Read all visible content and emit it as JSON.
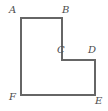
{
  "figure": {
    "kind": "l-shaped-polygon",
    "background_color": "#ffffff",
    "stroke_color": "#666666",
    "stroke_width": 1.2,
    "fill_color": "none",
    "label_color": "#4d4d4d",
    "width": 108,
    "height": 111,
    "vertices": [
      {
        "name": "A",
        "label": "A",
        "x": 21,
        "y": 18
      },
      {
        "name": "B",
        "label": "B",
        "x": 62,
        "y": 18
      },
      {
        "name": "C",
        "label": "C",
        "x": 62,
        "y": 60
      },
      {
        "name": "D",
        "label": "D",
        "x": 95,
        "y": 60
      },
      {
        "name": "E",
        "label": "E",
        "x": 95,
        "y": 95
      },
      {
        "name": "F",
        "label": "F",
        "x": 21,
        "y": 95
      }
    ],
    "path": "M 21 18 L 62 18 L 62 60 L 95 60 L 95 95 L 21 95 Z",
    "edges": [
      {
        "name": "AB",
        "from": "A",
        "to": "B"
      },
      {
        "name": "BC",
        "from": "B",
        "to": "C"
      },
      {
        "name": "CD",
        "from": "C",
        "to": "D"
      },
      {
        "name": "DE",
        "from": "D",
        "to": "E"
      },
      {
        "name": "EF",
        "from": "E",
        "to": "F"
      },
      {
        "name": "FA",
        "from": "F",
        "to": "A"
      }
    ]
  }
}
